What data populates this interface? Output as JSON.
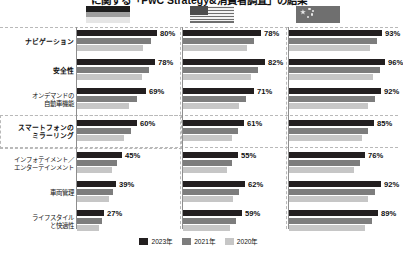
{
  "title": "に関する「PwC Strategy&消費者調査」の結果",
  "legend_position": "bottom-center",
  "colors": {
    "series_2023": "#231f20",
    "series_2021": "#7d7d7d",
    "series_2020": "#c6c6c6",
    "axis": "#8e8e8e",
    "dash": "#b9b9b9",
    "text": "#111111",
    "background": "#ffffff"
  },
  "flags": [
    {
      "name": "germany-flag",
      "country": "ドイツ",
      "stripes": [
        "#1a1a1a",
        "#b5b5b5",
        "#e8e8e8"
      ]
    },
    {
      "name": "usa-flag",
      "country": "アメリカ",
      "stripes": [
        "#cfcfcf",
        "#6e6e6e",
        "#cfcfcf"
      ]
    },
    {
      "name": "china-flag",
      "country": "中国",
      "stripes": [
        "#6f6f6f",
        "#6f6f6f",
        "#6f6f6f"
      ]
    }
  ],
  "legend": [
    {
      "label": "2023年",
      "color": "#231f20"
    },
    {
      "label": "2021年",
      "color": "#7d7d7d"
    },
    {
      "label": "2020年",
      "color": "#c6c6c6"
    }
  ],
  "chart_data": {
    "type": "bar",
    "title": "に関する「PwC Strategy&消費者調査」の結果",
    "xlabel": "",
    "ylabel": "",
    "xlim": [
      0,
      100
    ],
    "grid": false,
    "orientation": "horizontal",
    "unit": "%",
    "panels": [
      "ドイツ",
      "アメリカ",
      "中国"
    ],
    "categories": [
      "ナビゲーション",
      "安全性",
      "オンデマンドの\n自動車機能",
      "スマートフォンの\nミラーリング",
      "インフォテイメント／\nエンターテインメント",
      "車両管理",
      "ライフスタイル\nと快適性"
    ],
    "series": [
      {
        "name": "2023年",
        "color": "#231f20",
        "values_by_panel": {
          "ドイツ": [
            80,
            78,
            69,
            60,
            45,
            39,
            27
          ],
          "アメリカ": [
            78,
            82,
            71,
            61,
            55,
            62,
            59
          ],
          "中国": [
            93,
            96,
            92,
            85,
            76,
            92,
            89
          ]
        }
      },
      {
        "name": "2021年",
        "color": "#7d7d7d",
        "values_by_panel": {
          "ドイツ": [
            74,
            72,
            60,
            54,
            40,
            36,
            25
          ],
          "アメリカ": [
            71,
            75,
            63,
            55,
            49,
            56,
            53
          ],
          "中国": [
            88,
            91,
            86,
            79,
            71,
            86,
            83
          ]
        }
      },
      {
        "name": "2020年",
        "color": "#c6c6c6",
        "values_by_panel": {
          "ドイツ": [
            66,
            65,
            52,
            47,
            35,
            32,
            22
          ],
          "アメリカ": [
            64,
            68,
            56,
            49,
            44,
            50,
            47
          ],
          "中国": [
            81,
            84,
            79,
            73,
            65,
            79,
            76
          ]
        }
      }
    ],
    "labeled_values": {
      "ドイツ": [
        "80%",
        "78%",
        "69%",
        "60%",
        "45%",
        "39%",
        "27%"
      ],
      "アメリカ": [
        "78%",
        "82%",
        "71%",
        "61%",
        "55%",
        "62%",
        "59%"
      ],
      "中国": [
        "93%",
        "96%",
        "92%",
        "85%",
        "76%",
        "92%",
        "89%"
      ]
    }
  }
}
